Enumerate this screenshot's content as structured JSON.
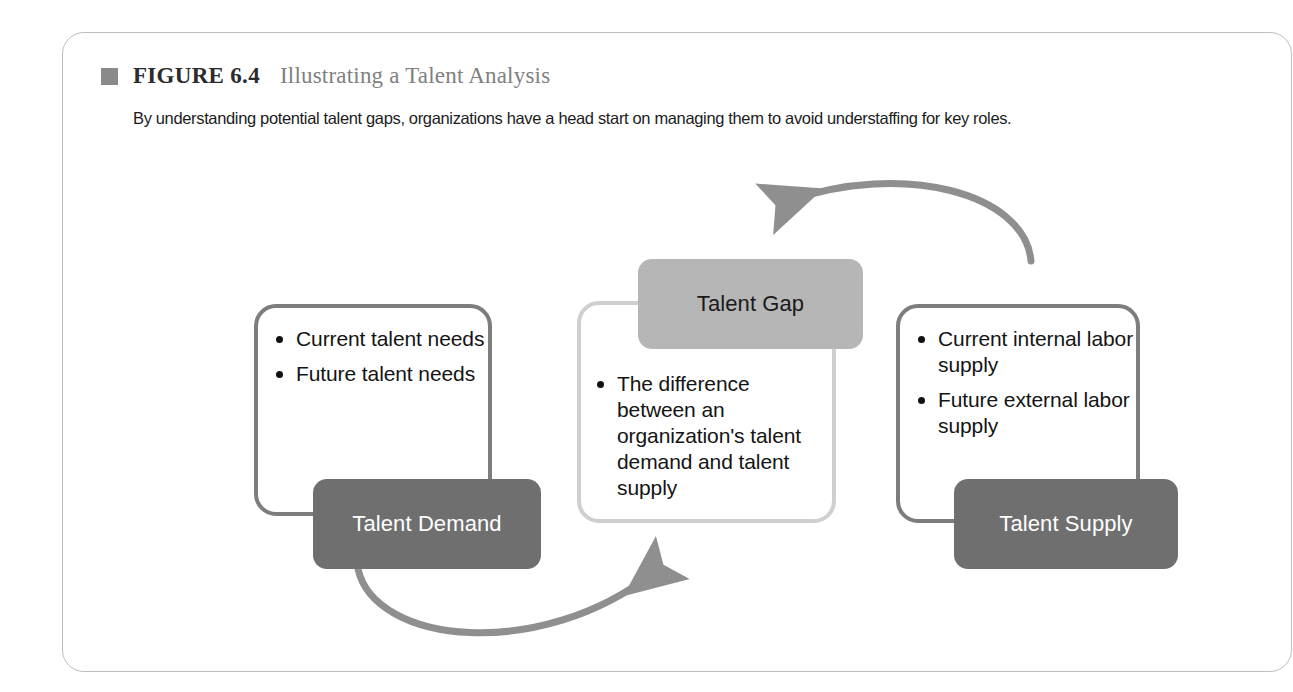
{
  "figure": {
    "marker_icon": "square-marker-icon",
    "label": "FIGURE 6.4",
    "title": "Illustrating a Talent Analysis",
    "subtitle": "By understanding potential talent gaps, organizations have a head start on managing them to avoid understaffing for key roles."
  },
  "diagram": {
    "type": "process-cycle-diagram",
    "nodes": [
      {
        "id": "talent-demand",
        "pill_label": "Talent Demand",
        "pill_color": "#6f6f6f",
        "pill_text_color": "#ffffff",
        "box_border_color": "#7d7d7d",
        "bullets": [
          "Current talent needs",
          "Future talent needs"
        ]
      },
      {
        "id": "talent-gap",
        "pill_label": "Talent Gap",
        "pill_color": "#b6b6b6",
        "pill_text_color": "#1a1a1a",
        "box_border_color": "#cfcfcf",
        "bullets": [
          "The difference between an organization's talent demand and talent supply"
        ]
      },
      {
        "id": "talent-supply",
        "pill_label": "Talent Supply",
        "pill_color": "#6f6f6f",
        "pill_text_color": "#ffffff",
        "box_border_color": "#7d7d7d",
        "bullets": [
          "Current internal labor supply",
          "Future external labor supply"
        ]
      }
    ],
    "arrows": [
      {
        "id": "supply-to-gap",
        "from": "talent-supply",
        "to": "talent-gap",
        "color": "#8f8f8f",
        "direction": "right-to-left-over-top"
      },
      {
        "id": "demand-to-gap",
        "from": "talent-demand",
        "to": "talent-gap",
        "color": "#8f8f8f",
        "direction": "left-to-right-under-bottom"
      }
    ],
    "arrow_color": "#8f8f8f"
  },
  "card": {
    "border_color": "#bdbdbd",
    "background": "#ffffff"
  }
}
